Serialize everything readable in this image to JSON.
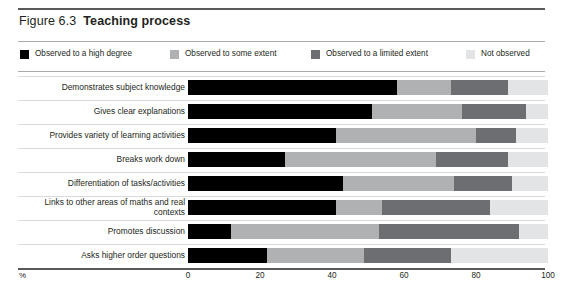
{
  "figure": {
    "number": "Figure 6.3",
    "title": "Teaching process",
    "axis_unit": "%"
  },
  "colors": {
    "high": "#000000",
    "some": "#b0b1b3",
    "limited": "#6d6e71",
    "not": "#e3e4e5",
    "rule_dark": "#58595b",
    "rule_light": "#a7a9ac",
    "row_sep": "#d9dadb",
    "text": "#231f20"
  },
  "legend": {
    "items": [
      {
        "label": "Observed to a high degree",
        "color": "#000000",
        "x": 0
      },
      {
        "label": "Observed to some extent",
        "color": "#b0b1b3",
        "x": 150
      },
      {
        "label": "Observed to a limited extent",
        "color": "#6d6e71",
        "x": 291
      },
      {
        "label": "Not observed",
        "color": "#e3e4e5",
        "x": 446
      }
    ]
  },
  "chart_data": {
    "type": "bar",
    "subtype": "stacked-horizontal-100",
    "title": "Teaching process",
    "xlabel": "%",
    "ylabel": "",
    "xlim": [
      0,
      100
    ],
    "ticks": [
      0,
      20,
      40,
      60,
      80,
      100
    ],
    "grid": false,
    "legend_position": "top",
    "categories": [
      "Demonstrates subject knowledge",
      "Gives clear explanations",
      "Provides variety of learning activities",
      "Breaks work down",
      "Differentiation of tasks/activities",
      "Links to other areas of maths and real contexts",
      "Promotes discussion",
      "Asks higher order questions"
    ],
    "series": [
      {
        "name": "Observed to a high degree",
        "color": "#000000",
        "values": [
          58,
          51,
          41,
          27,
          43,
          41,
          12,
          22
        ]
      },
      {
        "name": "Observed to some extent",
        "color": "#b0b1b3",
        "values": [
          15,
          25,
          39,
          42,
          31,
          13,
          41,
          27
        ]
      },
      {
        "name": "Observed to a limited extent",
        "color": "#6d6e71",
        "values": [
          16,
          18,
          11,
          20,
          16,
          30,
          39,
          24
        ]
      },
      {
        "name": "Not observed",
        "color": "#e3e4e5",
        "values": [
          11,
          6,
          9,
          11,
          10,
          16,
          8,
          27
        ]
      }
    ]
  }
}
